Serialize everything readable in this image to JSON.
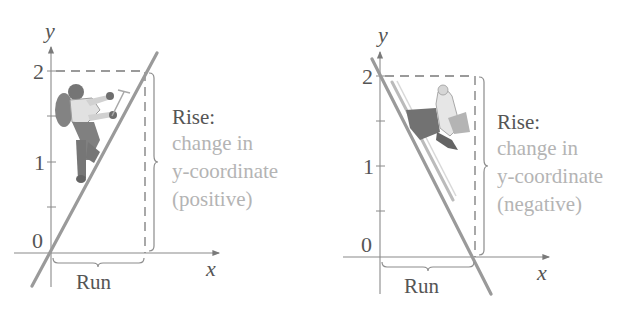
{
  "figure": {
    "panels": [
      {
        "id": "positive-slope",
        "axes": {
          "x_label": "x",
          "y_label": "y",
          "y_ticks": [
            "0",
            "1",
            "2"
          ]
        },
        "line": {
          "from": [
            0,
            0
          ],
          "to": [
            1,
            2
          ],
          "direction": "rising"
        },
        "illustration": "mountain-climber",
        "rise_label": {
          "title": "Rise:",
          "lines": [
            "change in",
            "y-coordinate",
            "(positive)"
          ]
        },
        "run_label": "Run"
      },
      {
        "id": "negative-slope",
        "axes": {
          "x_label": "x",
          "y_label": "y",
          "y_ticks": [
            "0",
            "1",
            "2"
          ]
        },
        "line": {
          "from": [
            0,
            2
          ],
          "to": [
            1,
            0
          ],
          "direction": "falling"
        },
        "illustration": "downhill-skier",
        "rise_label": {
          "title": "Rise:",
          "lines": [
            "change in",
            "y-coordinate",
            "(negative)"
          ]
        },
        "run_label": "Run"
      }
    ],
    "colors": {
      "axis": "#8a8a8a",
      "line": "#9a9a9a",
      "dark_text": "#555555",
      "light_text": "#b4b4b4"
    }
  }
}
